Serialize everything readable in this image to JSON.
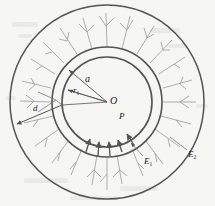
{
  "figure": {
    "kind": "engineering-diagram",
    "background_color": "#f4f4f2",
    "line_color": "#1a1a1a",
    "hatch_color": "#6b6b6b",
    "geometry": {
      "center": {
        "x": 107,
        "y": 102
      },
      "inner_circle_radius": 45,
      "ring_outer_radius": 55,
      "outer_circle_radius": 97
    },
    "labels": [
      {
        "id": "a",
        "text": "a",
        "meaning": "outer radius of inner core"
      },
      {
        "id": "r1",
        "text": "r",
        "sub": "1",
        "meaning": "inner radius"
      },
      {
        "id": "O",
        "text": "O",
        "meaning": "center point"
      },
      {
        "id": "P",
        "text": "P",
        "meaning": "internal pressure"
      },
      {
        "id": "d",
        "text": "d",
        "meaning": "crack length direction"
      },
      {
        "id": "E1",
        "text": "E",
        "sub": "1",
        "meaning": "modulus of inner medium"
      },
      {
        "id": "E2",
        "text": "E",
        "sub": "2",
        "meaning": "modulus of outer medium"
      }
    ],
    "annotations": {
      "pressure_arrows_count": 5,
      "pressure_arrow_direction": "inward",
      "radial_cracks_count": 26,
      "crack_style": "branching radial lines"
    }
  }
}
